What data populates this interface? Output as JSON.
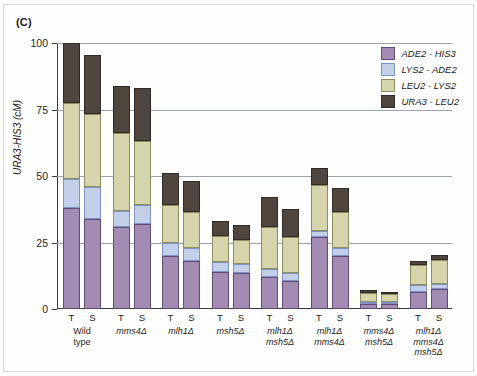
{
  "figure": {
    "panel_label": "(C)"
  },
  "chart_data": {
    "type": "bar",
    "stacked": true,
    "title": "",
    "xlabel": "",
    "ylabel": "URA3-HIS3 (cM)",
    "ylim": [
      0,
      100
    ],
    "yticks": [
      0,
      25,
      50,
      75,
      100
    ],
    "ytick_labels": [
      "0",
      "25",
      "50",
      "75",
      "100"
    ],
    "grid": "horizontal",
    "legend_position": "top-right",
    "series": [
      {
        "name": "ADE2 - HIS3",
        "key": "s3",
        "color": "#a28cb4",
        "values": [
          38.0,
          34.0,
          31.0,
          32.0,
          20.0,
          18.0,
          14.0,
          13.5,
          12.0,
          10.5,
          27.0,
          20.0,
          1.8,
          1.8,
          6.5,
          7.5,
          8.0,
          9.5
        ]
      },
      {
        "name": "LYS2 - ADE2",
        "key": "s2",
        "color": "#c3cee8",
        "values": [
          11.0,
          12.0,
          6.0,
          7.0,
          5.0,
          5.0,
          3.5,
          3.5,
          3.0,
          3.0,
          2.5,
          3.0,
          0.6,
          0.6,
          2.5,
          2.0,
          2.0,
          2.0
        ]
      },
      {
        "name": "LEU2 - LYS2",
        "key": "s1",
        "color": "#d6d4ac",
        "values": [
          28.5,
          27.5,
          29.0,
          24.0,
          14.0,
          13.5,
          10.0,
          9.0,
          16.0,
          13.5,
          17.0,
          13.5,
          3.5,
          3.0,
          7.5,
          9.0,
          8.5,
          9.5
        ]
      },
      {
        "name": "URA3 - LEU2",
        "key": "s0",
        "color": "#4e463f",
        "values": [
          22.5,
          22.0,
          18.0,
          20.0,
          12.0,
          11.5,
          5.5,
          5.5,
          11.0,
          10.5,
          6.5,
          9.0,
          1.0,
          0.8,
          1.5,
          2.0,
          1.5,
          2.0
        ]
      }
    ],
    "groups": [
      {
        "label_lines": [
          "Wild",
          "type"
        ],
        "italic": false,
        "bars": [
          {
            "tick": "T",
            "total": 100.0
          },
          {
            "tick": "S",
            "total": 95.5
          }
        ]
      },
      {
        "label_lines": [
          "mms4Δ"
        ],
        "italic": true,
        "bars": [
          {
            "tick": "T",
            "total": 84.0
          },
          {
            "tick": "S",
            "total": 83.0
          }
        ]
      },
      {
        "label_lines": [
          "mlh1Δ"
        ],
        "italic": true,
        "bars": [
          {
            "tick": "T",
            "total": 51.0
          },
          {
            "tick": "S",
            "total": 48.0
          }
        ]
      },
      {
        "label_lines": [
          "msh5Δ"
        ],
        "italic": true,
        "bars": [
          {
            "tick": "T",
            "total": 33.0
          },
          {
            "tick": "S",
            "total": 31.5
          }
        ]
      },
      {
        "label_lines": [
          "mlh1Δ",
          "msh5Δ"
        ],
        "italic": true,
        "bars": [
          {
            "tick": "T",
            "total": 42.0
          },
          {
            "tick": "S",
            "total": 37.5
          }
        ]
      },
      {
        "label_lines": [
          "mlh1Δ",
          "mms4Δ"
        ],
        "italic": true,
        "bars": [
          {
            "tick": "T",
            "total": 53.0
          },
          {
            "tick": "S",
            "total": 45.5
          }
        ]
      },
      {
        "label_lines": [
          "mms4Δ",
          "msh5Δ"
        ],
        "italic": true,
        "bars": [
          {
            "tick": "T",
            "total": 6.9
          },
          {
            "tick": "S",
            "total": 6.2
          }
        ]
      },
      {
        "label_lines": [
          "mlh1Δ",
          "mms4Δ",
          "msh5Δ"
        ],
        "italic": true,
        "bars": [
          {
            "tick": "T",
            "total": 18.0
          },
          {
            "tick": "S",
            "total": 20.5
          }
        ]
      }
    ],
    "group_order_note": "bars listed left-to-right, two bars (T then S) per group"
  },
  "legend": {
    "items": [
      {
        "label": "ADE2 - HIS3",
        "key": "s3"
      },
      {
        "label": "LYS2 - ADE2",
        "key": "s2"
      },
      {
        "label": "LEU2 - LYS2",
        "key": "s1"
      },
      {
        "label": "URA3 - LEU2",
        "key": "s0"
      }
    ]
  }
}
